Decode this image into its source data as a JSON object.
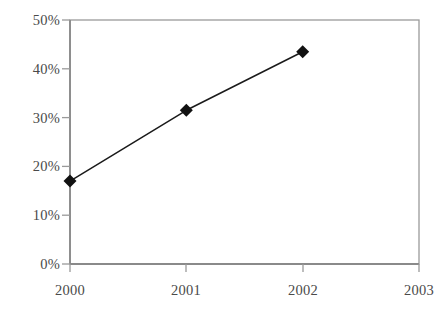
{
  "chart_data": {
    "type": "line",
    "title": "",
    "subtitle": "",
    "xlabel": "",
    "ylabel": "",
    "x": [
      "2000",
      "2001",
      "2002",
      "2003"
    ],
    "categories": [
      "2000",
      "2001",
      "2002",
      "2003"
    ],
    "values": [
      17,
      31.5,
      43.5,
      null
    ],
    "series": [
      {
        "name": "",
        "values": [
          17,
          31.5,
          43.5,
          null
        ]
      }
    ],
    "xtick_labels": [
      "2000",
      "2001",
      "2002",
      "2003"
    ],
    "ytick_labels": [
      "0%",
      "10%",
      "20%",
      "30%",
      "40%",
      "50%"
    ],
    "ytick_values": [
      0,
      10,
      20,
      30,
      40,
      50
    ],
    "ylim": [
      0,
      50
    ],
    "grid": false,
    "legend": false,
    "legend_position": "none",
    "marker": "diamond",
    "line_color": "#1a1a1a",
    "marker_color": "#111111",
    "axis_color": "#9a9a9a",
    "tick_label_color": "#4a4a4a",
    "background_color": "#ffffff"
  },
  "axes": {
    "y_labels": [
      "50%",
      "40%",
      "30%",
      "20%",
      "10%",
      "0%"
    ],
    "x_labels": [
      "2000",
      "2001",
      "2002",
      "2003"
    ]
  }
}
